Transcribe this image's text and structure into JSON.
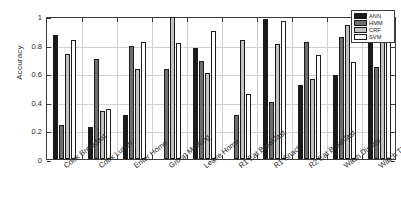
{
  "chart_data": {
    "type": "bar",
    "title": "",
    "xlabel": "",
    "ylabel": "Accuracy",
    "ylim": [
      0,
      1
    ],
    "yticks": [
      "0",
      "0.2",
      "0.4",
      "0.6",
      "0.8",
      "1"
    ],
    "ytick_values": [
      0,
      0.2,
      0.4,
      0.6,
      0.8,
      1
    ],
    "grid": true,
    "legend_position": "top-right",
    "categories": [
      "Cook Breakfast",
      "Cook Lunch",
      "Enter Home",
      "Group Meeting",
      "Leave Home",
      "R1 Eat Breakfast",
      "R1 Snack",
      "R2 Eat Breakfast",
      "Wash Dishes",
      "Watch TV"
    ],
    "series": [
      {
        "name": "ANN",
        "color": "#1a1a1a",
        "values": [
          0.87,
          0.225,
          0.31,
          0.0,
          0.775,
          0.0,
          0.98,
          0.52,
          0.59,
          0.955
        ]
      },
      {
        "name": "HMM",
        "color": "#6e6e6e",
        "values": [
          0.235,
          0.7,
          0.79,
          0.63,
          0.685,
          0.31,
          0.4,
          0.815,
          0.855,
          0.645
        ]
      },
      {
        "name": "CRF",
        "color": "#c2c2c2",
        "values": [
          0.735,
          0.335,
          0.63,
          0.995,
          0.605,
          0.835,
          0.805,
          0.56,
          0.94,
          0.945
        ]
      },
      {
        "name": "SVM",
        "color": "#ffffff",
        "values": [
          0.835,
          0.35,
          0.815,
          0.81,
          0.895,
          0.455,
          0.965,
          0.73,
          0.675,
          0.98
        ]
      }
    ]
  },
  "legend": {
    "items": [
      {
        "label": "ANN"
      },
      {
        "label": "HMM"
      },
      {
        "label": "CRF"
      },
      {
        "label": "SVM"
      }
    ]
  }
}
